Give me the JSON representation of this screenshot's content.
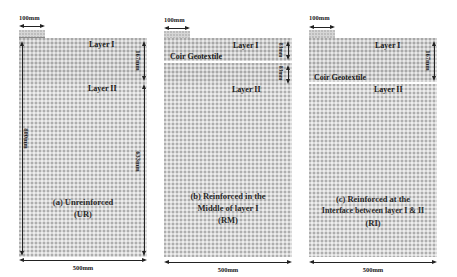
{
  "panels": [
    {
      "id": "a",
      "footing_width": "100mm",
      "layer1": "Layer I",
      "layer2": "Layer II",
      "dim_total_height": "800mm",
      "dim_layer1": "167mm",
      "dim_layer2": "633mm",
      "dim_width": "500mm",
      "caption_line1_prefix": "(a) ",
      "caption_line1": "Unreinforced",
      "caption_line2": "(UR)"
    },
    {
      "id": "b",
      "footing_width": "100mm",
      "layer1": "Layer I",
      "layer2": "Layer II",
      "geotextile": "Coir Geotextile",
      "dim_upper": "83mm",
      "dim_lower": "83mm",
      "dim_width": "500mm",
      "caption_line1_prefix": "(b) ",
      "caption_line1": "Reinforced in the",
      "caption_line2": "Middle of layer I",
      "caption_line3": "(RM)"
    },
    {
      "id": "c",
      "footing_width": "100mm",
      "layer1": "Layer I",
      "layer2": "Layer II",
      "geotextile": "Coir Geotextile",
      "dim_layer1": "167mm",
      "dim_width": "500mm",
      "caption_line1_prefix": "(c) ",
      "caption_line1": "Reinforced at the",
      "caption_line2": "Interface between layer I & II",
      "caption_line3": "(RI)"
    }
  ],
  "colors": {
    "mesh": "#d9d9d9",
    "layer1": "#cfcfcf",
    "geotextile": "#ffffff",
    "text": "#1a1a1a"
  }
}
